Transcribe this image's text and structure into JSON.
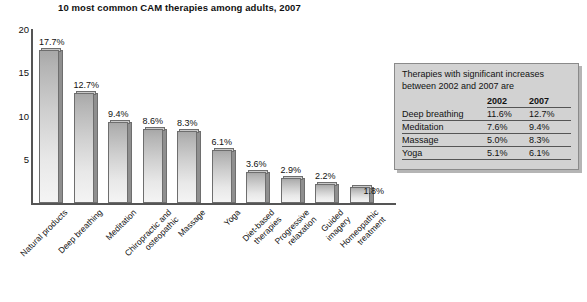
{
  "chart_data": {
    "type": "bar",
    "title": "10 most common CAM therapies among adults, 2007",
    "xlabel": "",
    "ylabel": "",
    "ylim": [
      0,
      20
    ],
    "yticks": [
      "5",
      "10",
      "15",
      "20"
    ],
    "grid": false,
    "legend": "none",
    "categories": [
      "Natural products",
      "Deep breathing",
      "Meditation",
      "Chiropractic and\nosteopathic",
      "Massage",
      "Yoga",
      "Diet-based\ntherapies",
      "Progressive\nrelaxation",
      "Guided\nimagery",
      "Homeopathic\ntreatment"
    ],
    "values": [
      17.7,
      12.7,
      9.4,
      8.6,
      8.3,
      6.1,
      3.6,
      2.9,
      2.2,
      1.8
    ],
    "data_labels": [
      "17.7%",
      "12.7%",
      "9.4%",
      "8.6%",
      "8.3%",
      "6.1%",
      "3.6%",
      "2.9%",
      "2.2%",
      "1.8%"
    ]
  },
  "inset": {
    "caption": "Therapies with significant increases between 2002 and 2007 are",
    "headers": [
      "",
      "2002",
      "2007"
    ],
    "rows": [
      {
        "therapy": "Deep breathing",
        "y2002": "11.6%",
        "y2007": "12.7%"
      },
      {
        "therapy": "Meditation",
        "y2002": "7.6%",
        "y2007": "9.4%"
      },
      {
        "therapy": "Massage",
        "y2002": "5.0%",
        "y2007": "8.3%"
      },
      {
        "therapy": "Yoga",
        "y2002": "5.1%",
        "y2007": "6.1%"
      }
    ]
  },
  "colors": {
    "bar_face_light": "#f4f4f4",
    "bar_face_dark": "#a8a8a8",
    "bar_side": "#8f8f8f",
    "bar_outline": "#6e6e6e",
    "axis": "#555555",
    "inset_bg": "#d2d2d2",
    "text": "#111111"
  }
}
